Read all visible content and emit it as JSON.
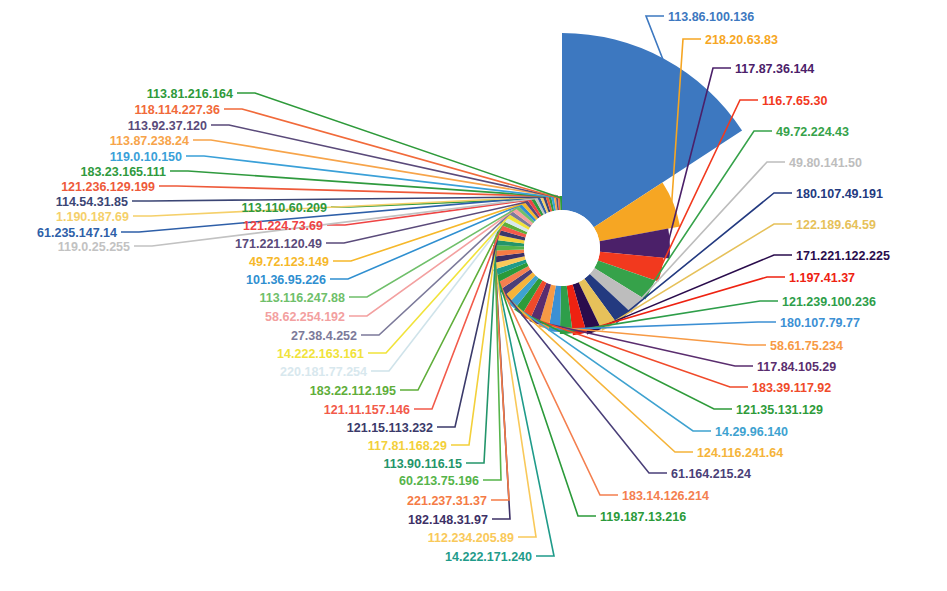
{
  "chart_data": {
    "type": "pie",
    "subtype": "radial-rose (variable radius donut)",
    "title": "",
    "center": [
      562,
      248
    ],
    "inner_radius": 38,
    "slices": [
      {
        "label": "113.86.100.136",
        "value": 100,
        "radius": 215,
        "color": "#3d78c0",
        "label_pos": [
          668,
          16
        ],
        "side": "right"
      },
      {
        "label": "218.20.63.83",
        "value": 40,
        "radius": 120,
        "color": "#f6a623",
        "label_pos": [
          705,
          39
        ],
        "side": "right"
      },
      {
        "label": "117.87.36.144",
        "value": 28,
        "radius": 108,
        "color": "#4b2069",
        "label_pos": [
          735,
          68
        ],
        "side": "right"
      },
      {
        "label": "116.7.65.30",
        "value": 24,
        "radius": 102,
        "color": "#f2391e",
        "label_pos": [
          762,
          100
        ],
        "side": "right"
      },
      {
        "label": "49.72.224.43",
        "value": 22,
        "radius": 98,
        "color": "#36a24a",
        "label_pos": [
          776,
          131
        ],
        "side": "right"
      },
      {
        "label": "49.80.141.50",
        "value": 20,
        "radius": 95,
        "color": "#bdbdbd",
        "label_pos": [
          789,
          162
        ],
        "side": "right"
      },
      {
        "label": "180.107.49.191",
        "value": 19,
        "radius": 93,
        "color": "#233a80",
        "label_pos": [
          796,
          193
        ],
        "side": "right"
      },
      {
        "label": "122.189.64.59",
        "value": 18,
        "radius": 92,
        "color": "#e6c15a",
        "label_pos": [
          796,
          224
        ],
        "side": "right"
      },
      {
        "label": "171.221.122.225",
        "value": 17,
        "radius": 90,
        "color": "#2a0c4c",
        "label_pos": [
          796,
          255
        ],
        "side": "right"
      },
      {
        "label": "1.197.41.37",
        "value": 16,
        "radius": 88,
        "color": "#ee2211",
        "label_pos": [
          789,
          277
        ],
        "side": "right"
      },
      {
        "label": "121.239.100.236",
        "value": 15,
        "radius": 86,
        "color": "#2e9e4a",
        "label_pos": [
          782,
          301
        ],
        "side": "right"
      },
      {
        "label": "180.107.79.77",
        "value": 14,
        "radius": 84,
        "color": "#3c90d4",
        "label_pos": [
          780,
          322
        ],
        "side": "right"
      },
      {
        "label": "58.61.75.234",
        "value": 13,
        "radius": 82,
        "color": "#f79a45",
        "label_pos": [
          770,
          345
        ],
        "side": "right"
      },
      {
        "label": "117.84.105.29",
        "value": 13,
        "radius": 80,
        "color": "#5a2d6e",
        "label_pos": [
          757,
          366
        ],
        "side": "right"
      },
      {
        "label": "183.39.117.92",
        "value": 12,
        "radius": 79,
        "color": "#f04a2a",
        "label_pos": [
          752,
          387
        ],
        "side": "right"
      },
      {
        "label": "121.35.131.129",
        "value": 12,
        "radius": 78,
        "color": "#2e9b3a",
        "label_pos": [
          736,
          409
        ],
        "side": "right"
      },
      {
        "label": "14.29.96.140",
        "value": 11,
        "radius": 77,
        "color": "#3ea2d0",
        "label_pos": [
          715,
          431
        ],
        "side": "right"
      },
      {
        "label": "124.116.241.64",
        "value": 11,
        "radius": 76,
        "color": "#f5b43a",
        "label_pos": [
          697,
          452
        ],
        "side": "right"
      },
      {
        "label": "61.164.215.24",
        "value": 10,
        "radius": 75,
        "color": "#4a3f78",
        "label_pos": [
          671,
          473
        ],
        "side": "right"
      },
      {
        "label": "183.14.126.214",
        "value": 10,
        "radius": 74,
        "color": "#f47f4f",
        "label_pos": [
          622,
          495
        ],
        "side": "right"
      },
      {
        "label": "119.187.13.216",
        "value": 10,
        "radius": 73,
        "color": "#2b9a3a",
        "label_pos": [
          600,
          516
        ],
        "side": "right"
      },
      {
        "label": "14.222.171.240",
        "value": 9,
        "radius": 72,
        "color": "#1f9b8a",
        "label_pos": [
          532,
          556
        ],
        "side": "left"
      },
      {
        "label": "112.234.205.89",
        "value": 9,
        "radius": 71,
        "color": "#f9c95a",
        "label_pos": [
          514,
          537
        ],
        "side": "left"
      },
      {
        "label": "182.148.31.97",
        "value": 9,
        "radius": 70,
        "color": "#3d3066",
        "label_pos": [
          488,
          519
        ],
        "side": "left"
      },
      {
        "label": "221.237.31.37",
        "value": 9,
        "radius": 70,
        "color": "#f57b45",
        "label_pos": [
          487,
          500
        ],
        "side": "left"
      },
      {
        "label": "60.213.75.196",
        "value": 8,
        "radius": 69,
        "color": "#56b44a",
        "label_pos": [
          479,
          480
        ],
        "side": "left"
      },
      {
        "label": "113.90.116.15",
        "value": 8,
        "radius": 68,
        "color": "#23956a",
        "label_pos": [
          462,
          463
        ],
        "side": "left"
      },
      {
        "label": "117.81.168.29",
        "value": 8,
        "radius": 68,
        "color": "#f3d03a",
        "label_pos": [
          447,
          445
        ],
        "side": "left"
      },
      {
        "label": "121.15.113.232",
        "value": 8,
        "radius": 67,
        "color": "#3b3a6a",
        "label_pos": [
          433,
          427
        ],
        "side": "left"
      },
      {
        "label": "121.11.157.146",
        "value": 8,
        "radius": 66,
        "color": "#f25a4a",
        "label_pos": [
          410,
          409
        ],
        "side": "left"
      },
      {
        "label": "183.22.112.195",
        "value": 7,
        "radius": 66,
        "color": "#5fae3a",
        "label_pos": [
          396,
          390
        ],
        "side": "left"
      },
      {
        "label": "220.181.77.254",
        "value": 7,
        "radius": 65,
        "color": "#d8e8ee",
        "label_pos": [
          367,
          371
        ],
        "side": "left"
      },
      {
        "label": "14.222.163.161",
        "value": 7,
        "radius": 64,
        "color": "#f1e33a",
        "label_pos": [
          364,
          353
        ],
        "side": "left"
      },
      {
        "label": "27.38.4.252",
        "value": 7,
        "radius": 64,
        "color": "#7c7a9a",
        "label_pos": [
          357,
          335
        ],
        "side": "left"
      },
      {
        "label": "58.62.254.192",
        "value": 7,
        "radius": 63,
        "color": "#f3a0a0",
        "label_pos": [
          345,
          316
        ],
        "side": "left"
      },
      {
        "label": "113.116.247.88",
        "value": 6,
        "radius": 62,
        "color": "#6fbf6a",
        "label_pos": [
          345,
          297
        ],
        "side": "left"
      },
      {
        "label": "101.36.95.226",
        "value": 6,
        "radius": 62,
        "color": "#2f8fd0",
        "label_pos": [
          326,
          279
        ],
        "side": "left"
      },
      {
        "label": "49.72.123.149",
        "value": 6,
        "radius": 61,
        "color": "#f6b82a",
        "label_pos": [
          329,
          261
        ],
        "side": "left"
      },
      {
        "label": "171.221.120.49",
        "value": 6,
        "radius": 60,
        "color": "#5a4a7a",
        "label_pos": [
          322,
          243
        ],
        "side": "left"
      },
      {
        "label": "121.224.73.69",
        "value": 6,
        "radius": 60,
        "color": "#ef4444",
        "label_pos": [
          323,
          225
        ],
        "side": "left"
      },
      {
        "label": "113.110.60.209",
        "value": 6,
        "radius": 59,
        "color": "#2f9a3e",
        "label_pos": [
          327,
          207
        ],
        "side": "left"
      },
      {
        "label": "119.0.25.255",
        "value": 5,
        "radius": 58,
        "color": "#c2c2c2",
        "label_pos": [
          130,
          246
        ],
        "side": "left"
      },
      {
        "label": "61.235.147.14",
        "value": 5,
        "radius": 58,
        "color": "#2e5fa8",
        "label_pos": [
          117,
          232
        ],
        "side": "left"
      },
      {
        "label": "1.190.187.69",
        "value": 5,
        "radius": 57,
        "color": "#f5d06a",
        "label_pos": [
          129,
          216
        ],
        "side": "left"
      },
      {
        "label": "114.54.31.85",
        "value": 5,
        "radius": 56,
        "color": "#3b4574",
        "label_pos": [
          128,
          201
        ],
        "side": "left"
      },
      {
        "label": "121.236.129.199",
        "value": 5,
        "radius": 56,
        "color": "#ee5a3a",
        "label_pos": [
          155,
          186
        ],
        "side": "left"
      },
      {
        "label": "183.23.165.111",
        "value": 5,
        "radius": 55,
        "color": "#2f9a3e",
        "label_pos": [
          166,
          171
        ],
        "side": "left"
      },
      {
        "label": "119.0.10.150",
        "value": 5,
        "radius": 54,
        "color": "#3aa0d8",
        "label_pos": [
          182,
          156
        ],
        "side": "left"
      },
      {
        "label": "113.87.238.24",
        "value": 4,
        "radius": 54,
        "color": "#f7a44a",
        "label_pos": [
          189,
          140
        ],
        "side": "left"
      },
      {
        "label": "113.92.37.120",
        "value": 4,
        "radius": 53,
        "color": "#5a4a7a",
        "label_pos": [
          207,
          125
        ],
        "side": "left"
      },
      {
        "label": "118.114.227.36",
        "value": 4,
        "radius": 52,
        "color": "#f16a3a",
        "label_pos": [
          220,
          109
        ],
        "side": "left"
      },
      {
        "label": "113.81.216.164",
        "value": 4,
        "radius": 52,
        "color": "#2e9a3a",
        "label_pos": [
          233,
          93
        ],
        "side": "left"
      }
    ]
  }
}
